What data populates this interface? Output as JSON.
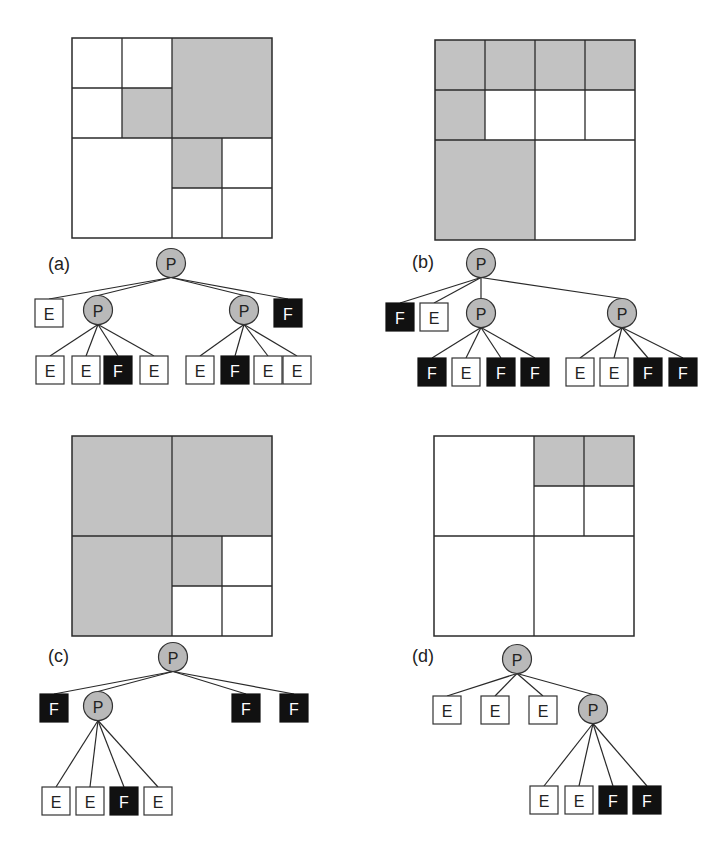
{
  "legend": {
    "P": "partial node",
    "E": "empty leaf",
    "F": "full leaf"
  },
  "colors": {
    "full_cell": "#c2c2c2",
    "partial_node": "#b9b9b9",
    "full_node": "#111111",
    "empty_node": "#ffffff"
  },
  "panels": [
    {
      "label": "(a)",
      "quadtree": {
        "type": "P",
        "children": [
          {
            "type": "P",
            "children": [
              {
                "type": "E"
              },
              {
                "type": "E"
              },
              {
                "type": "E"
              },
              {
                "type": "F"
              }
            ]
          },
          {
            "type": "F"
          },
          {
            "type": "E"
          },
          {
            "type": "P",
            "children": [
              {
                "type": "F"
              },
              {
                "type": "E"
              },
              {
                "type": "E"
              },
              {
                "type": "E"
              }
            ]
          }
        ]
      },
      "tree": {
        "root": "P",
        "level1": [
          "E",
          "P",
          "P",
          "F"
        ],
        "level2": [
          {
            "parent_index": 1,
            "children": [
              "E",
              "E",
              "F",
              "E"
            ]
          },
          {
            "parent_index": 2,
            "children": [
              "E",
              "F",
              "E",
              "E"
            ]
          }
        ]
      }
    },
    {
      "label": "(b)",
      "quadtree": {
        "type": "P",
        "children": [
          {
            "type": "P",
            "children": [
              {
                "type": "F"
              },
              {
                "type": "F"
              },
              {
                "type": "F"
              },
              {
                "type": "E"
              }
            ]
          },
          {
            "type": "P",
            "children": [
              {
                "type": "F"
              },
              {
                "type": "F"
              },
              {
                "type": "E"
              },
              {
                "type": "E"
              }
            ]
          },
          {
            "type": "F"
          },
          {
            "type": "E"
          }
        ]
      },
      "tree": {
        "root": "P",
        "level1": [
          "F",
          "E",
          "P",
          "P"
        ],
        "level2": [
          {
            "parent_index": 2,
            "children": [
              "F",
              "E",
              "F",
              "F"
            ]
          },
          {
            "parent_index": 3,
            "children": [
              "E",
              "E",
              "F",
              "F"
            ]
          }
        ]
      }
    },
    {
      "label": "(c)",
      "quadtree": {
        "type": "P",
        "children": [
          {
            "type": "F"
          },
          {
            "type": "F"
          },
          {
            "type": "F"
          },
          {
            "type": "P",
            "children": [
              {
                "type": "F"
              },
              {
                "type": "E"
              },
              {
                "type": "E"
              },
              {
                "type": "E"
              }
            ]
          }
        ]
      },
      "tree": {
        "root": "P",
        "level1": [
          "F",
          "P",
          "F",
          "F"
        ],
        "level2": [
          {
            "parent_index": 1,
            "children": [
              "E",
              "E",
              "F",
              "E"
            ]
          }
        ]
      }
    },
    {
      "label": "(d)",
      "quadtree": {
        "type": "P",
        "children": [
          {
            "type": "E"
          },
          {
            "type": "P",
            "children": [
              {
                "type": "F"
              },
              {
                "type": "F"
              },
              {
                "type": "E"
              },
              {
                "type": "E"
              }
            ]
          },
          {
            "type": "E"
          },
          {
            "type": "E"
          }
        ]
      },
      "tree": {
        "root": "P",
        "level1": [
          "E",
          "E",
          "E",
          "P"
        ],
        "level2": [
          {
            "parent_index": 3,
            "children": [
              "E",
              "E",
              "F",
              "F"
            ]
          }
        ]
      }
    }
  ]
}
